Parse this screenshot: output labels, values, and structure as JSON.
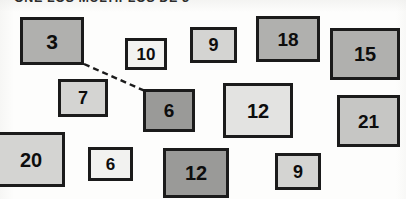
{
  "header": {
    "text": "ONE LOS MULTIPLOS DE 3",
    "note": "partially cropped handwritten-print heading at top edge"
  },
  "canvas": {
    "width": 406,
    "height": 199,
    "background": "#fdfdfc"
  },
  "palette": {
    "border": "#1b1b1b",
    "text": "#0d0d0d",
    "near_white": "#f2f2f0",
    "light_gray": "#d4d4d2",
    "light_medium_gray": "#c6c6c4",
    "medium_gray": "#b0b0ae",
    "dark_medium_gray": "#9a9a98"
  },
  "connector": {
    "name": "dashed-connector",
    "from_box_index": 0,
    "to_box_index": 6,
    "x1": 84,
    "y1": 64,
    "x2": 145,
    "y2": 91,
    "style": "dashed",
    "color": "#1b1b1b",
    "width": 2.4,
    "dash": "6 4"
  },
  "boxes": [
    {
      "label": "3",
      "x": 20,
      "y": 17,
      "w": 64,
      "h": 48,
      "fill": "#b0b0ae",
      "font_size": 21
    },
    {
      "label": "10",
      "x": 125,
      "y": 38,
      "w": 42,
      "h": 32,
      "fill": "#f2f2f0",
      "font_size": 17
    },
    {
      "label": "9",
      "x": 190,
      "y": 27,
      "w": 47,
      "h": 36,
      "fill": "#d4d4d2",
      "font_size": 18
    },
    {
      "label": "18",
      "x": 256,
      "y": 16,
      "w": 64,
      "h": 46,
      "fill": "#b0b0ae",
      "font_size": 19
    },
    {
      "label": "15",
      "x": 330,
      "y": 28,
      "w": 70,
      "h": 52,
      "fill": "#b0b0ae",
      "font_size": 20
    },
    {
      "label": "7",
      "x": 58,
      "y": 79,
      "w": 50,
      "h": 38,
      "fill": "#d4d4d2",
      "font_size": 18
    },
    {
      "label": "6",
      "x": 143,
      "y": 89,
      "w": 52,
      "h": 43,
      "fill": "#9a9a98",
      "font_size": 19
    },
    {
      "label": "12",
      "x": 223,
      "y": 83,
      "w": 70,
      "h": 55,
      "fill": "#e3e3e1",
      "font_size": 20
    },
    {
      "label": "21",
      "x": 337,
      "y": 95,
      "w": 63,
      "h": 52,
      "fill": "#c6c6c4",
      "font_size": 19
    },
    {
      "label": "20",
      "x": -3,
      "y": 132,
      "w": 68,
      "h": 55,
      "fill": "#d4d4d2",
      "font_size": 20
    },
    {
      "label": "6",
      "x": 88,
      "y": 147,
      "w": 45,
      "h": 34,
      "fill": "#f2f2f0",
      "font_size": 17
    },
    {
      "label": "12",
      "x": 163,
      "y": 148,
      "w": 66,
      "h": 50,
      "fill": "#9a9a98",
      "font_size": 20
    },
    {
      "label": "9",
      "x": 275,
      "y": 153,
      "w": 46,
      "h": 37,
      "fill": "#d4d4d2",
      "font_size": 18
    }
  ]
}
